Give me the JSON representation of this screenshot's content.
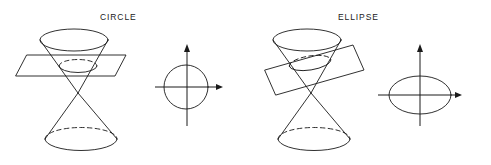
{
  "figure": {
    "width": 491,
    "height": 165,
    "background_color": "#ffffff",
    "stroke_color": "#1a1a1a"
  },
  "panels": [
    {
      "id": "circle",
      "label": "CIRCLE",
      "description": "Double cone cut by a horizontal plane, producing a circular cross-section",
      "plane_orientation": "horizontal",
      "resulting_curve": "circle",
      "cone": {
        "type": "double-napped cone",
        "apex": {
          "x": 78,
          "y": 93
        },
        "upper_rim": {
          "cx": 74,
          "cy": 40,
          "rx": 34,
          "ry": 11
        },
        "section_curve": {
          "cx": 78,
          "cy": 66,
          "rx": 19,
          "ry": 6.5
        },
        "lower_base": {
          "cx": 81,
          "cy": 139,
          "rx": 36,
          "ry": 11.5
        }
      },
      "plane": {
        "shape": "parallelogram",
        "corners": [
          {
            "x": 27,
            "y": 55
          },
          {
            "x": 126,
            "y": 55
          },
          {
            "x": 115,
            "y": 76
          },
          {
            "x": 16,
            "y": 76
          }
        ]
      },
      "axes": {
        "origin": {
          "x": 187,
          "y": 87
        },
        "x_axis": {
          "from_x": 155,
          "to_x": 223,
          "y": 87
        },
        "y_axis": {
          "x": 187,
          "from_y": 45,
          "to_y": 126
        },
        "x_arrow": "right",
        "y_arrow": "up"
      },
      "curve": {
        "type": "circle",
        "cx": 186,
        "cy": 87,
        "rx": 22,
        "ry": 22
      }
    },
    {
      "id": "ellipse",
      "label": "ELLIPSE",
      "description": "Double cone cut by a tilted plane, producing an elliptical cross-section",
      "plane_orientation": "tilted",
      "resulting_curve": "ellipse",
      "cone": {
        "type": "double-napped cone",
        "apex": {
          "x": 311,
          "y": 93
        },
        "upper_rim": {
          "cx": 307,
          "cy": 40,
          "rx": 34,
          "ry": 11
        },
        "section_curve": {
          "cx": 310,
          "cy": 63,
          "rx": 21,
          "ry": 7
        },
        "lower_base": {
          "cx": 314,
          "cy": 139,
          "rx": 36,
          "ry": 11.5
        }
      },
      "plane": {
        "shape": "parallelogram",
        "corners": [
          {
            "x": 265,
            "y": 70
          },
          {
            "x": 353,
            "y": 45
          },
          {
            "x": 364,
            "y": 70
          },
          {
            "x": 276,
            "y": 95
          }
        ]
      },
      "axes": {
        "origin": {
          "x": 420,
          "y": 95
        },
        "x_axis": {
          "from_x": 378,
          "to_x": 462,
          "y": 95
        },
        "y_axis": {
          "x": 420,
          "from_y": 45,
          "to_y": 126
        },
        "x_arrow": "right",
        "y_arrow": "up"
      },
      "curve": {
        "type": "ellipse",
        "cx": 420,
        "cy": 95,
        "rx": 31,
        "ry": 19
      }
    }
  ]
}
